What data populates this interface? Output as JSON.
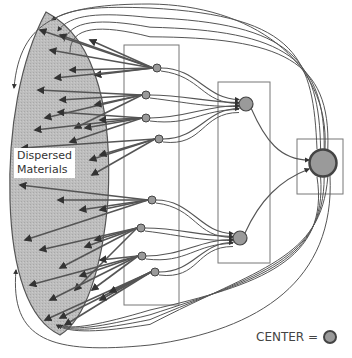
{
  "diagram": {
    "title": "",
    "dispersed_label_line1": "Dispersed",
    "dispersed_label_line2": "Materials",
    "legend": {
      "text": "CENTER =",
      "symbol": "center-node"
    },
    "colors": {
      "ellipse_fill": "#b8b8b8",
      "stroke": "#555555",
      "node_fill": "#9a9a9a",
      "box_stroke": "#777777",
      "background": "#ffffff"
    },
    "tiers": [
      {
        "name": "sources",
        "node_count": 0
      },
      {
        "name": "tier-1",
        "node_count": 8
      },
      {
        "name": "tier-2",
        "node_count": 2
      },
      {
        "name": "center",
        "node_count": 1
      }
    ]
  }
}
